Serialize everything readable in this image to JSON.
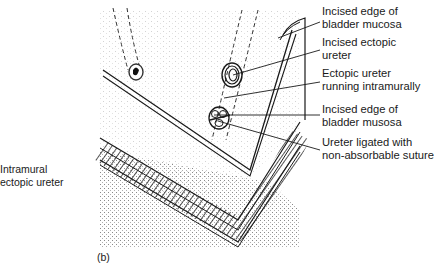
{
  "figure": {
    "panel_label": "(b)",
    "left_label": {
      "line1": "Intramural",
      "line2": "ectopic ureter"
    },
    "callouts": [
      {
        "line1": "Incised edge of",
        "line2": "bladder mucosa"
      },
      {
        "line1": "Incised ectopic",
        "line2": "ureter"
      },
      {
        "line1": "Ectopic ureter",
        "line2": "running intramurally"
      },
      {
        "line1": "Incised edge of",
        "line2": "bladder musosa"
      },
      {
        "line1": "Ureter ligated with",
        "line2": "non-absorbable suture"
      }
    ],
    "colors": {
      "ink": "#1a1a1a",
      "stipple": "#9a9a9a",
      "background": "#ffffff"
    }
  }
}
